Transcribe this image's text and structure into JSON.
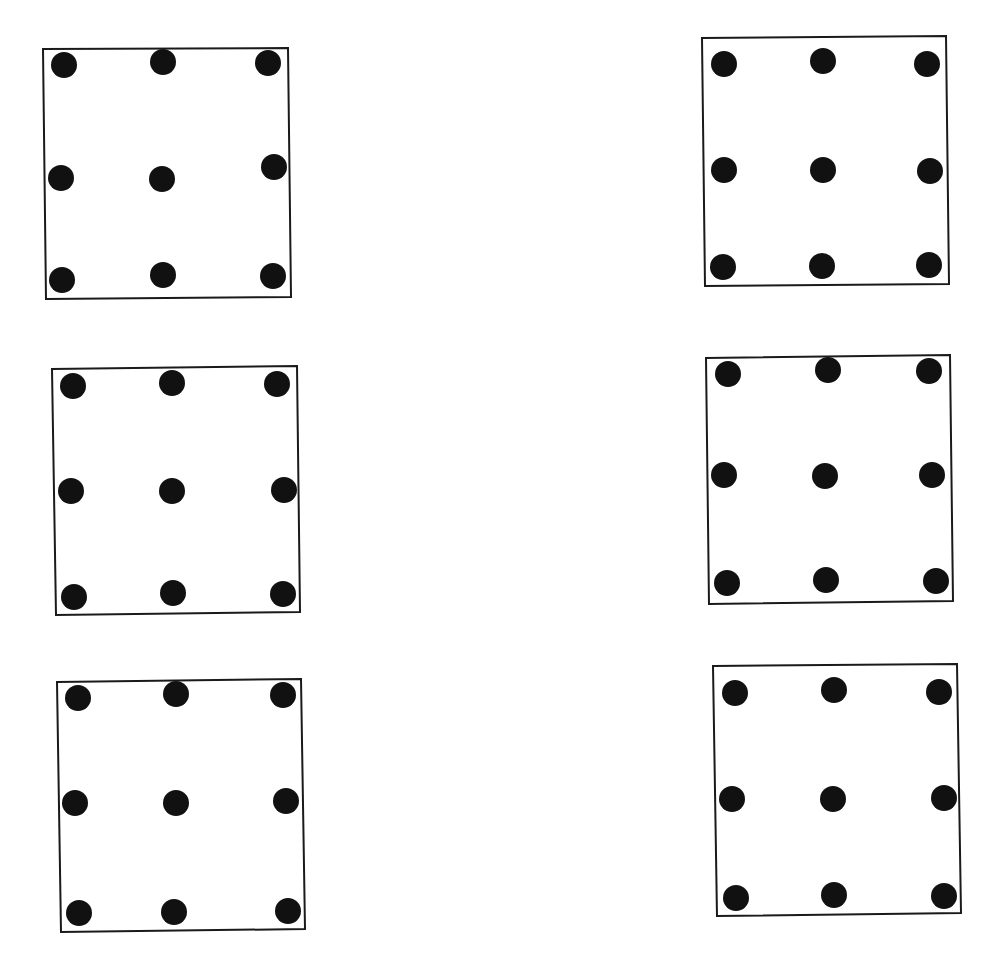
{
  "diagram": {
    "colors": {
      "background": "#ffffff",
      "stroke": "#1a1a1a",
      "dot": "#111111"
    },
    "dot_radius": 13,
    "panels": [
      {
        "id": "panel-1",
        "corners": [
          [
            43,
            49
          ],
          [
            288,
            48
          ],
          [
            291,
            297
          ],
          [
            46,
            299
          ]
        ],
        "dots": [
          [
            64,
            65
          ],
          [
            163,
            62
          ],
          [
            268,
            63
          ],
          [
            61,
            178
          ],
          [
            162,
            179
          ],
          [
            274,
            167
          ],
          [
            62,
            280
          ],
          [
            163,
            275
          ],
          [
            273,
            276
          ]
        ]
      },
      {
        "id": "panel-2",
        "corners": [
          [
            702,
            38
          ],
          [
            946,
            36
          ],
          [
            949,
            284
          ],
          [
            705,
            286
          ]
        ],
        "dots": [
          [
            724,
            64
          ],
          [
            823,
            61
          ],
          [
            927,
            64
          ],
          [
            724,
            170
          ],
          [
            823,
            170
          ],
          [
            930,
            171
          ],
          [
            723,
            267
          ],
          [
            822,
            266
          ],
          [
            929,
            265
          ]
        ]
      },
      {
        "id": "panel-3",
        "corners": [
          [
            52,
            369
          ],
          [
            297,
            366
          ],
          [
            300,
            612
          ],
          [
            56,
            615
          ]
        ],
        "dots": [
          [
            73,
            386
          ],
          [
            172,
            383
          ],
          [
            277,
            384
          ],
          [
            71,
            491
          ],
          [
            172,
            491
          ],
          [
            284,
            490
          ],
          [
            74,
            597
          ],
          [
            173,
            593
          ],
          [
            283,
            594
          ]
        ]
      },
      {
        "id": "panel-4",
        "corners": [
          [
            706,
            358
          ],
          [
            950,
            355
          ],
          [
            953,
            601
          ],
          [
            709,
            604
          ]
        ],
        "dots": [
          [
            728,
            374
          ],
          [
            828,
            370
          ],
          [
            929,
            371
          ],
          [
            724,
            475
          ],
          [
            825,
            476
          ],
          [
            932,
            475
          ],
          [
            727,
            583
          ],
          [
            826,
            580
          ],
          [
            936,
            581
          ]
        ]
      },
      {
        "id": "panel-5",
        "corners": [
          [
            57,
            682
          ],
          [
            301,
            679
          ],
          [
            305,
            929
          ],
          [
            61,
            932
          ]
        ],
        "dots": [
          [
            78,
            698
          ],
          [
            176,
            694
          ],
          [
            283,
            695
          ],
          [
            75,
            803
          ],
          [
            176,
            803
          ],
          [
            286,
            801
          ],
          [
            79,
            913
          ],
          [
            174,
            912
          ],
          [
            288,
            911
          ]
        ]
      },
      {
        "id": "panel-6",
        "corners": [
          [
            713,
            666
          ],
          [
            957,
            664
          ],
          [
            961,
            913
          ],
          [
            717,
            916
          ]
        ],
        "dots": [
          [
            735,
            693
          ],
          [
            834,
            690
          ],
          [
            939,
            692
          ],
          [
            732,
            799
          ],
          [
            833,
            799
          ],
          [
            944,
            798
          ],
          [
            736,
            898
          ],
          [
            834,
            895
          ],
          [
            944,
            896
          ]
        ]
      }
    ]
  }
}
